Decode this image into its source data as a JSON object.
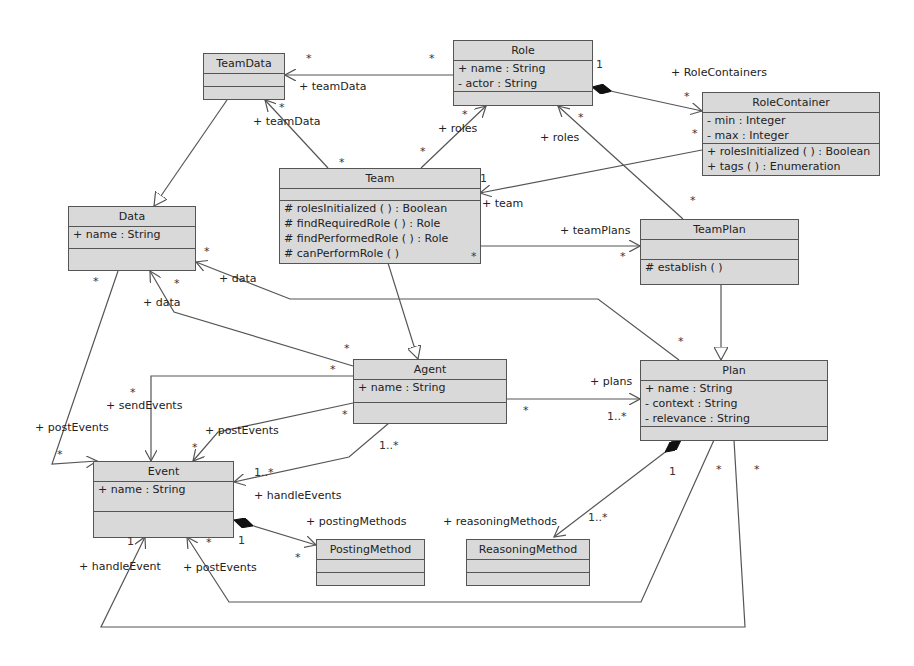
{
  "classes": {
    "teamdata": {
      "name": "TeamData",
      "attributes": [],
      "operations": []
    },
    "role": {
      "name": "Role",
      "attributes": [
        "+ name : String",
        "- actor : String"
      ],
      "operations": []
    },
    "rolecontainer": {
      "name": "RoleContainer",
      "attributes": [
        "- min : Integer",
        "- max : Integer"
      ],
      "operations": [
        "+ rolesInitialized ( ) : Boolean",
        "+ tags ( ) : Enumeration"
      ]
    },
    "team": {
      "name": "Team",
      "attributes": [],
      "operations": [
        "# rolesInitialized ( ) : Boolean",
        "# findRequiredRole ( ) : Role",
        "# findPerformedRole ( ) : Role",
        "# canPerformRole ( )"
      ]
    },
    "data": {
      "name": "Data",
      "attributes": [
        "+ name : String"
      ],
      "operations": []
    },
    "teamplan": {
      "name": "TeamPlan",
      "attributes": [],
      "operations": [
        "# establish ( )"
      ]
    },
    "agent": {
      "name": "Agent",
      "attributes": [
        "+ name : String"
      ],
      "operations": []
    },
    "plan": {
      "name": "Plan",
      "attributes": [
        "+ name : String",
        "- context : String",
        "- relevance : String"
      ],
      "operations": []
    },
    "event": {
      "name": "Event",
      "attributes": [
        "+ name : String"
      ],
      "operations": []
    },
    "postingmethod": {
      "name": "PostingMethod",
      "attributes": [],
      "operations": []
    },
    "reasoningmethod": {
      "name": "ReasoningMethod",
      "attributes": [],
      "operations": []
    }
  },
  "role_labels": {
    "role_teamdata": "+ teamData",
    "team_teamdata": "+ teamData",
    "team_roles": "+ roles",
    "teamplan_roles": "+ roles",
    "role_containers": "+ RoleContainers",
    "rc_team": "+ team",
    "team_plans": "+ teamPlans",
    "plan_data": "+ data",
    "agent_data": "+ data",
    "agent_plans": "+ plans",
    "data_postevents": "+ postEvents",
    "agent_sendevents": "+ sendEvents",
    "agent_postevents": "+ postEvents",
    "agent_handleevents": "+ handleEvents",
    "event_postingmethods": "+ postingMethods",
    "plan_reasoningmethods": "+ reasoningMethods",
    "plan_handleevent": "+ handleEvent",
    "plan_postevents": "+ postEvents"
  },
  "multiplicities": {
    "m1": "*",
    "m2": "*",
    "m3": "1",
    "m4": "*",
    "m5": "*",
    "m6": "*",
    "m7": "*",
    "m8": "*",
    "m9": "*",
    "m10": "1",
    "m11": "*",
    "m12": "*",
    "m13": "*",
    "m14": "*",
    "m15": "*",
    "m16": "*",
    "m17": "*",
    "m18": "*",
    "m19": "*",
    "m20": "1..*",
    "m21": "*",
    "m22": "*",
    "m23": "*",
    "m24": "1..*",
    "m25": "*",
    "m26": "*",
    "m27": "1",
    "m28": "1",
    "m29": "*",
    "m30": "1",
    "m31": "1..*",
    "m32": "*",
    "m33": "*",
    "m34": "*"
  }
}
